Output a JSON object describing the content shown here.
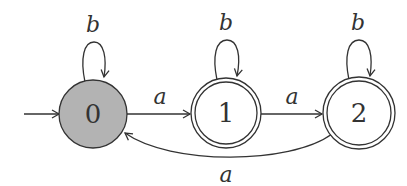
{
  "diagram": {
    "type": "finite-automaton",
    "colors": {
      "stroke": "#333333",
      "start_state_fill": "#b3b3b3",
      "state_fill": "#ffffff",
      "background": "#ffffff"
    },
    "states": [
      {
        "id": "0",
        "label": "0",
        "start": true,
        "accepting": false
      },
      {
        "id": "1",
        "label": "1",
        "start": false,
        "accepting": true
      },
      {
        "id": "2",
        "label": "2",
        "start": false,
        "accepting": true
      }
    ],
    "transitions": [
      {
        "from": "0",
        "to": "0",
        "label": "b"
      },
      {
        "from": "0",
        "to": "1",
        "label": "a"
      },
      {
        "from": "1",
        "to": "1",
        "label": "b"
      },
      {
        "from": "1",
        "to": "2",
        "label": "a"
      },
      {
        "from": "2",
        "to": "2",
        "label": "b"
      },
      {
        "from": "2",
        "to": "0",
        "label": "a"
      }
    ]
  }
}
